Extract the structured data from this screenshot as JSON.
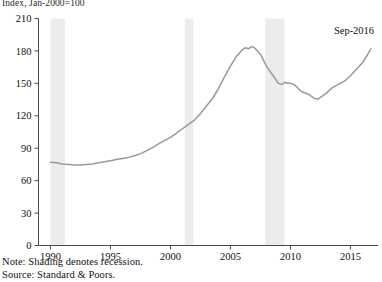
{
  "chart_data": {
    "type": "line",
    "title": "",
    "ylabel": "Index, Jan-2000=100",
    "xlabel": "",
    "ylim": [
      0,
      210
    ],
    "xlim": [
      1989.0,
      2017.3
    ],
    "yticks": [
      0,
      30,
      60,
      90,
      120,
      150,
      180,
      210
    ],
    "ytick_labels": [
      "0",
      "30",
      "60",
      "90",
      "120",
      "150",
      "180",
      "210"
    ],
    "xticks": [
      1990,
      1995,
      2000,
      2005,
      2010,
      2015
    ],
    "xtick_labels": [
      "1990",
      "1995",
      "2000",
      "2005",
      "2010",
      "2015"
    ],
    "grid": false,
    "legend": null,
    "line_color": "#999999",
    "shading_color": "#ececec",
    "annotations": [
      {
        "text": "Sep-2016",
        "x": 2015.3,
        "y": 196,
        "points_to_x": 2016.7,
        "points_to_y": 182
      }
    ],
    "shaded_regions": [
      {
        "label": "recession",
        "x_start": 1990.0,
        "x_end": 1991.2
      },
      {
        "label": "recession",
        "x_start": 2001.2,
        "x_end": 2001.9
      },
      {
        "label": "recession",
        "x_start": 2007.9,
        "x_end": 2009.5
      }
    ],
    "series": [
      {
        "name": "Home Price Index",
        "x": [
          1990.0,
          1990.5,
          1991.0,
          1991.5,
          1992.0,
          1992.5,
          1993.0,
          1993.5,
          1994.0,
          1994.5,
          1995.0,
          1995.5,
          1996.0,
          1996.5,
          1997.0,
          1997.5,
          1998.0,
          1998.5,
          1999.0,
          1999.5,
          2000.0,
          2000.5,
          2001.0,
          2001.5,
          2002.0,
          2002.5,
          2003.0,
          2003.5,
          2004.0,
          2004.5,
          2005.0,
          2005.5,
          2006.0,
          2006.25,
          2006.5,
          2006.75,
          2007.0,
          2007.5,
          2008.0,
          2008.5,
          2009.0,
          2009.3,
          2009.5,
          2009.75,
          2010.0,
          2010.3,
          2010.5,
          2010.75,
          2011.0,
          2011.5,
          2012.0,
          2012.3,
          2012.5,
          2013.0,
          2013.5,
          2014.0,
          2014.5,
          2015.0,
          2015.5,
          2016.0,
          2016.4,
          2016.7
        ],
        "y": [
          77,
          76.5,
          75.5,
          75,
          74.5,
          74.5,
          75,
          75.5,
          76.5,
          77.5,
          78.5,
          79.5,
          80.5,
          81.5,
          83,
          85,
          87.5,
          90.5,
          94,
          97,
          100,
          104,
          108,
          112,
          116,
          122,
          129,
          136,
          145,
          156,
          166,
          175,
          181,
          183,
          182,
          184,
          183,
          177,
          166,
          158,
          150,
          149,
          151,
          150,
          150,
          149,
          147,
          144,
          142,
          140,
          136,
          135.5,
          137,
          141,
          146,
          149,
          152,
          157,
          163,
          169,
          176,
          182
        ],
        "units": "index"
      }
    ],
    "notes": [
      "Note: Shading denotes recession.",
      "Source: Standard & Poors."
    ]
  }
}
